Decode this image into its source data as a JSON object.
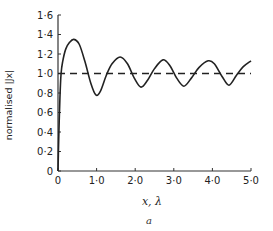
{
  "chart_data": {
    "type": "line",
    "title": "",
    "caption": "a",
    "xlabel": "x, λ",
    "ylabel": "normalised |Jx|",
    "xlim": [
      0,
      5.0
    ],
    "ylim": [
      0,
      1.6
    ],
    "xticks": [
      0,
      1.0,
      2.0,
      3.0,
      4.0,
      5.0
    ],
    "xtick_labels": [
      "0",
      "1·0",
      "2·0",
      "3·0",
      "4·0",
      "5·0"
    ],
    "yticks": [
      0,
      0.2,
      0.4,
      0.6,
      0.8,
      1.0,
      1.2,
      1.4,
      1.6
    ],
    "ytick_labels": [
      "0",
      "0·2",
      "0·4",
      "0·6",
      "0·8",
      "1·0",
      "1·2",
      "1·4",
      "1·6"
    ],
    "grid": false,
    "series": [
      {
        "name": "normalised |Jx|",
        "style": "solid",
        "x": [
          0,
          0.02,
          0.05,
          0.08,
          0.12,
          0.2,
          0.3,
          0.41,
          0.55,
          0.7,
          0.85,
          0.98,
          1.1,
          1.25,
          1.4,
          1.61,
          1.8,
          1.98,
          2.15,
          2.32,
          2.5,
          2.72,
          2.9,
          3.08,
          3.26,
          3.45,
          3.65,
          3.89,
          4.05,
          4.25,
          4.43,
          4.62,
          4.8,
          5.0
        ],
        "y": [
          0,
          0.35,
          0.75,
          1.0,
          1.12,
          1.25,
          1.32,
          1.35,
          1.3,
          1.12,
          0.9,
          0.78,
          0.82,
          0.98,
          1.1,
          1.17,
          1.1,
          0.95,
          0.86,
          0.93,
          1.05,
          1.14,
          1.08,
          0.95,
          0.87,
          0.95,
          1.06,
          1.13,
          1.1,
          0.97,
          0.88,
          0.98,
          1.07,
          1.13
        ]
      },
      {
        "name": "reference",
        "style": "dashed",
        "x": [
          0,
          5.0
        ],
        "y": [
          1.0,
          1.0
        ]
      }
    ]
  }
}
